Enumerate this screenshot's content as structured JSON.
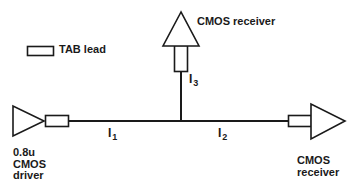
{
  "diagram": {
    "background_color": "#ffffff",
    "stroke_color": "#1a1a1a",
    "legend": {
      "symbol": "tab-lead-rectangle",
      "label": "TAB lead"
    },
    "components": [
      {
        "id": "driver",
        "shape": "triangle-right",
        "label": "0.8u\nCMOS\ndriver",
        "label_lines": [
          "0.8u",
          "CMOS",
          "driver"
        ]
      },
      {
        "id": "top-receiver",
        "shape": "triangle-up",
        "label": "CMOS receiver",
        "label_lines": [
          "CMOS receiver"
        ]
      },
      {
        "id": "right-receiver",
        "shape": "triangle-right",
        "label": "CMOS\nreceiver",
        "label_lines": [
          "CMOS",
          "receiver"
        ]
      }
    ],
    "currents": [
      {
        "id": "i1",
        "symbol": "I",
        "subscript": "1"
      },
      {
        "id": "i2",
        "symbol": "I",
        "subscript": "2"
      },
      {
        "id": "i3",
        "symbol": "I",
        "subscript": "3"
      }
    ]
  }
}
